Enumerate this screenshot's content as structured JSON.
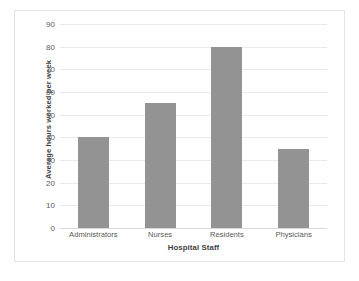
{
  "chart_data": {
    "type": "bar",
    "title": "",
    "subtitle": "",
    "categories": [
      "Administrators",
      "Nurses",
      "Residents",
      "Physicians"
    ],
    "values": [
      40,
      55,
      80,
      35
    ],
    "xlabel": "Hospital Staff",
    "ylabel": "Average hours worked per week",
    "ylim": [
      0,
      90
    ],
    "ytick_interval": 10,
    "yticks": [
      90,
      80,
      70,
      60,
      50,
      40,
      30,
      20,
      10,
      0
    ],
    "ytick_labels": [
      "90",
      "80",
      "70",
      "60",
      "50",
      "40",
      "30",
      "20",
      "10",
      "0"
    ],
    "grid": "horizontal",
    "legend": "none",
    "series": [
      {
        "name": "Average hours worked per week",
        "values": [
          40,
          55,
          80,
          35
        ]
      }
    ]
  },
  "style": {
    "bar_color": "#939393",
    "gridline_color": "#e9e9e9",
    "baseline_color": "#d8d8d8",
    "frame_border_color": "#e3e3e3",
    "background_color": "#ffffff",
    "tick_label_color": "#5a5a5a",
    "axis_title_color": "#3f3f3f"
  }
}
